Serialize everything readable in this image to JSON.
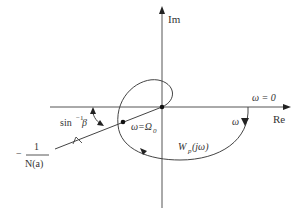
{
  "diagram": {
    "type": "nyquist-describing-function-plot",
    "axes": {
      "imag_label": "Im",
      "real_label": "Re"
    },
    "labels": {
      "omega_zero": "ω = 0",
      "omega": "ω",
      "omega_intersection": "ω=Ω",
      "omega_intersection_sub": "0",
      "transfer_fn_main": "W",
      "transfer_fn_sub": "p",
      "transfer_fn_arg": " (jω)",
      "angle_prefix": "sin",
      "angle_sup": "−1",
      "angle_var": " β",
      "neg_inv_minus": "−",
      "neg_inv_num": "1",
      "neg_inv_den": "N(a)"
    },
    "colors": {
      "stroke": "#444444",
      "axis": "#555555",
      "background": "#ffffff"
    }
  }
}
